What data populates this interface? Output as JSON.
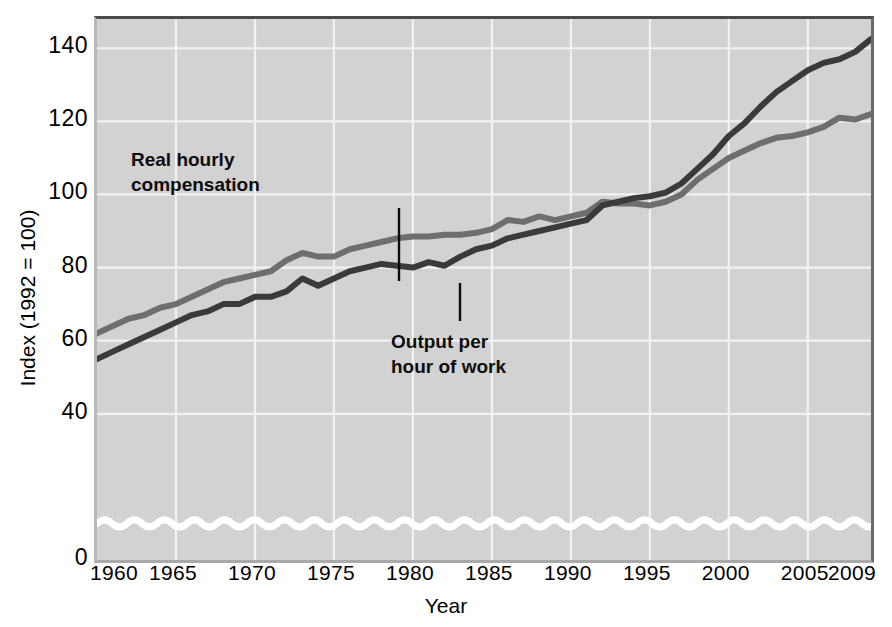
{
  "chart_data": {
    "type": "line",
    "title": "",
    "xlabel": "Year",
    "ylabel": "Index (1992 = 100)",
    "xlim": [
      1960,
      2009
    ],
    "ylim": [
      0,
      148
    ],
    "grid": true,
    "legend_position": "inline-annotations",
    "y_ticks": [
      0,
      40,
      60,
      80,
      100,
      120,
      140
    ],
    "y_tick_labels": [
      "0",
      "40",
      "60",
      "80",
      "100",
      "120",
      "140"
    ],
    "x_ticks": [
      1960,
      1965,
      1970,
      1975,
      1980,
      1985,
      1990,
      1995,
      2000,
      2005,
      2009
    ],
    "x_tick_labels": [
      "1960",
      "1965",
      "1970",
      "1975",
      "1980",
      "1985",
      "1990",
      "1995",
      "2000",
      "2005",
      "2009"
    ],
    "axis_break": {
      "present": true,
      "style": "white-squiggle",
      "at_value": 10,
      "note": "wavy white line near bottom indicating broken y-axis"
    },
    "x": [
      1960,
      1961,
      1962,
      1963,
      1964,
      1965,
      1966,
      1967,
      1968,
      1969,
      1970,
      1971,
      1972,
      1973,
      1974,
      1975,
      1976,
      1977,
      1978,
      1979,
      1980,
      1981,
      1982,
      1983,
      1984,
      1985,
      1986,
      1987,
      1988,
      1989,
      1990,
      1991,
      1992,
      1993,
      1994,
      1995,
      1996,
      1997,
      1998,
      1999,
      2000,
      2001,
      2002,
      2003,
      2004,
      2005,
      2006,
      2007,
      2008,
      2009
    ],
    "series": [
      {
        "name": "Real hourly compensation",
        "color": "#6e6e6e",
        "values": [
          62,
          64,
          66,
          67,
          69,
          70,
          72,
          74,
          76,
          77,
          78,
          79,
          82,
          84,
          83,
          83,
          85,
          86,
          87,
          88,
          88.5,
          88.5,
          89,
          89,
          89.5,
          90.5,
          93,
          92.5,
          94,
          93,
          94,
          95,
          98,
          97.5,
          97.5,
          97,
          98,
          100,
          104,
          107,
          110,
          112,
          114,
          115.5,
          116,
          117,
          118.5,
          121,
          120.5,
          122
        ]
      },
      {
        "name": "Output per hour of work",
        "color": "#3a3a3a",
        "values": [
          55,
          57,
          59,
          61,
          63,
          65,
          67,
          68,
          70,
          70,
          72,
          72,
          73.5,
          77,
          75,
          77,
          79,
          80,
          81,
          80.5,
          80,
          81.5,
          80.5,
          83,
          85,
          86,
          88,
          89,
          90,
          91,
          92,
          93,
          97,
          98,
          99,
          99.5,
          100.5,
          103,
          107,
          111,
          116,
          119.5,
          124,
          128,
          131,
          134,
          136,
          137,
          139,
          142.5
        ]
      }
    ],
    "annotations": [
      {
        "id": "compensation",
        "text": "Real hourly\ncompensation",
        "target_series": "Real hourly compensation",
        "target_year": 1979
      },
      {
        "id": "output",
        "text": "Output per\nhour of work",
        "target_series": "Output per hour of work",
        "target_year": 1983
      }
    ],
    "colors": {
      "plot_background": "#d2d2d2",
      "gridline": "#f2f2f2",
      "axis_break_line": "#ffffff",
      "text": "#000000",
      "series_light": "#6e6e6e",
      "series_dark": "#3a3a3a"
    }
  }
}
